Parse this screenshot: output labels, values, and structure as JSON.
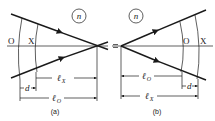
{
  "panels": [
    {
      "id": "a",
      "caption": "(a)",
      "medium_label": "n",
      "plane_labels": {
        "o": "O",
        "x": "X"
      },
      "dimensions": {
        "lx": {
          "base": "ℓ",
          "sub": "X"
        },
        "lo": {
          "base": "ℓ",
          "sub": "O"
        },
        "d": "d"
      },
      "description": "Converging rays meeting at a focus point beyond planes O and X"
    },
    {
      "id": "b",
      "caption": "(b)",
      "medium_label": "n",
      "plane_labels": {
        "o": "O",
        "x": "X"
      },
      "dimensions": {
        "lo": {
          "base": "ℓ",
          "sub": "O"
        },
        "lx": {
          "base": "ℓ",
          "sub": "X"
        },
        "d": "d"
      },
      "description": "Diverging rays from a point source passing planes O and X"
    }
  ],
  "colors": {
    "ink": "#1a1a1a",
    "background": "#ffffff"
  }
}
